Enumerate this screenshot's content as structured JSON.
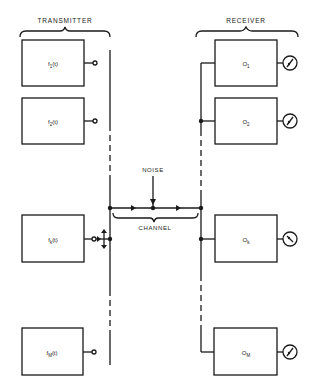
{
  "transmitter": {
    "label": "TRANSMITTER",
    "sources": [
      {
        "name": "f",
        "sub": "1",
        "arg": "(t)"
      },
      {
        "name": "f",
        "sub": "2",
        "arg": "(t)"
      },
      {
        "name": "f",
        "sub": "k",
        "arg": "(t)"
      },
      {
        "name": "f",
        "sub": "M",
        "arg": "(t)"
      }
    ]
  },
  "receiver": {
    "label": "RECEIVER",
    "outputs": [
      {
        "name": "O",
        "sub": "1"
      },
      {
        "name": "O",
        "sub": "2"
      },
      {
        "name": "O",
        "sub": "k"
      },
      {
        "name": "O",
        "sub": "M"
      }
    ]
  },
  "channel": {
    "label": "CHANNEL"
  },
  "noise": {
    "label": "NOISE"
  },
  "colors": {
    "line": "#1a1a1a",
    "background": "#ffffff"
  }
}
